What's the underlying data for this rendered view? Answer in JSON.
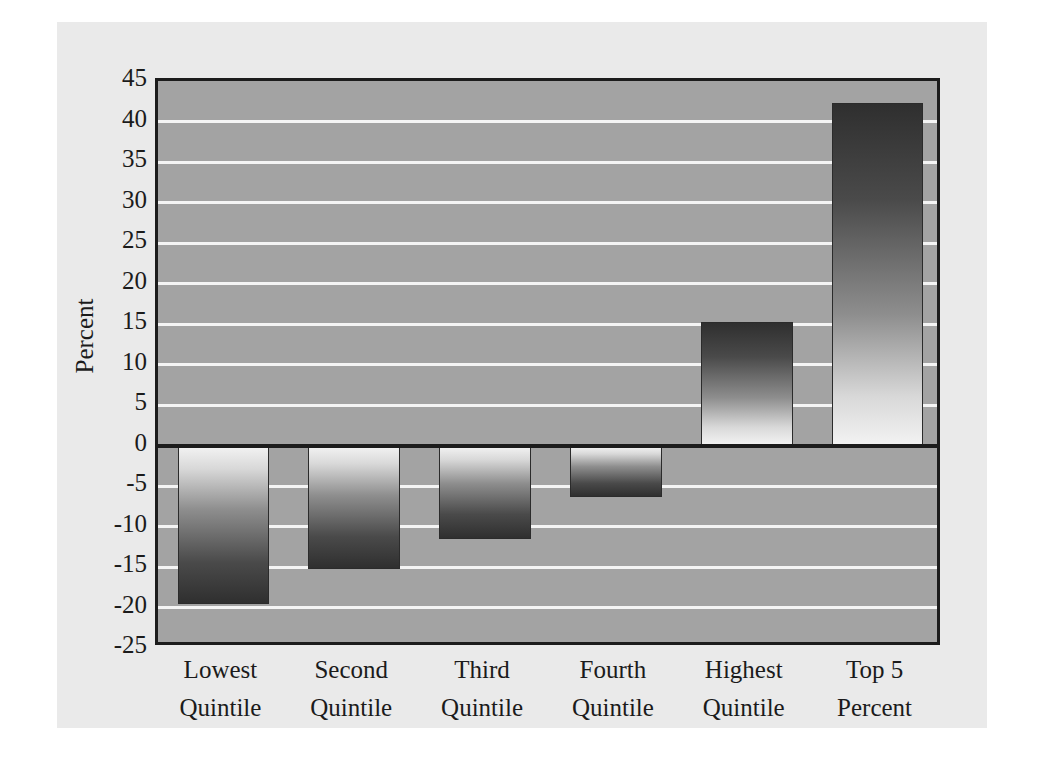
{
  "chart_data": {
    "type": "bar",
    "title": "",
    "xlabel": "",
    "ylabel": "Percent",
    "ylim": [
      -25,
      45
    ],
    "ytick_step": 5,
    "grid": true,
    "legend": "none",
    "categories": [
      "Lowest Quintile",
      "Second Quintile",
      "Third Quintile",
      "Fourth Quintile",
      "Highest Quintile",
      "Top 5 Percent"
    ],
    "category_lines": [
      [
        "Lowest",
        "Quintile"
      ],
      [
        "Second",
        "Quintile"
      ],
      [
        "Third",
        "Quintile"
      ],
      [
        "Fourth",
        "Quintile"
      ],
      [
        "Highest",
        "Quintile"
      ],
      [
        "Top 5",
        "Percent"
      ]
    ],
    "values": [
      -19.6,
      -15.3,
      -11.5,
      -6.3,
      15.2,
      42.3
    ],
    "ytick_labels": [
      "45",
      "40",
      "35",
      "30",
      "25",
      "20",
      "15",
      "10",
      "5",
      "0",
      "-5",
      "-10",
      "-15",
      "-20",
      "-25"
    ],
    "ytick_values": [
      45,
      40,
      35,
      30,
      25,
      20,
      15,
      10,
      5,
      0,
      -5,
      -10,
      -15,
      -20,
      -25
    ]
  },
  "colors": {
    "figure_background": "#eaeaea",
    "plot_background": "#a3a3a3",
    "gridline": "#f4f4f4",
    "axis_line": "#1c1c1c",
    "bar_dark": "#2f2f2f",
    "bar_light": "#f2f2f2",
    "text": "#1b1b1b"
  }
}
